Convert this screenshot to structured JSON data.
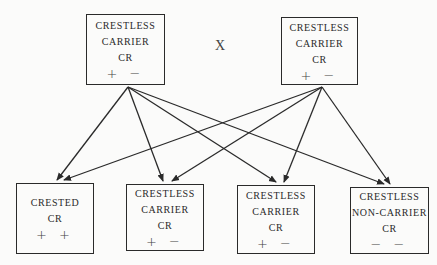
{
  "parents": [
    {
      "id": "p1",
      "lines": [
        "CRESTLESS",
        "CARRIER",
        "CR"
      ],
      "genotype": "+ −"
    },
    {
      "id": "p2",
      "lines": [
        "CRESTLESS",
        "CARRIER",
        "CR"
      ],
      "genotype": "+ −"
    }
  ],
  "cross_symbol": "X",
  "offspring": [
    {
      "id": "o1",
      "lines": [
        "CRESTED",
        "CR"
      ],
      "genotype": "+ +"
    },
    {
      "id": "o2",
      "lines": [
        "CRESTLESS",
        "CARRIER",
        "CR"
      ],
      "genotype": "+ −"
    },
    {
      "id": "o3",
      "lines": [
        "CRESTLESS",
        "CARRIER",
        "CR"
      ],
      "genotype": "+ −"
    },
    {
      "id": "o4",
      "lines": [
        "CRESTLESS",
        "NON-CARRIER",
        "CR"
      ],
      "genotype": "− −"
    }
  ],
  "edges": [
    {
      "from": "p1",
      "to": "o1"
    },
    {
      "from": "p1",
      "to": "o2"
    },
    {
      "from": "p1",
      "to": "o3"
    },
    {
      "from": "p1",
      "to": "o4"
    },
    {
      "from": "p2",
      "to": "o1"
    },
    {
      "from": "p2",
      "to": "o2"
    },
    {
      "from": "p2",
      "to": "o3"
    },
    {
      "from": "p2",
      "to": "o4"
    }
  ],
  "colors": {
    "line": "#2a2a2a",
    "background": "#fbfbfa"
  }
}
